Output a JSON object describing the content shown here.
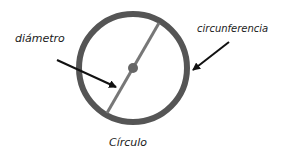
{
  "diagram": {
    "title": "Círculo",
    "labels": {
      "diameter": "diámetro",
      "circumference": "circunferencia",
      "caption": "Círculo"
    },
    "colors": {
      "ring": "#555555",
      "diameter_line": "#777777",
      "center_dot": "#666666",
      "arrows": "#111111",
      "text": "#1a1a1a",
      "background": "#ffffff"
    }
  }
}
